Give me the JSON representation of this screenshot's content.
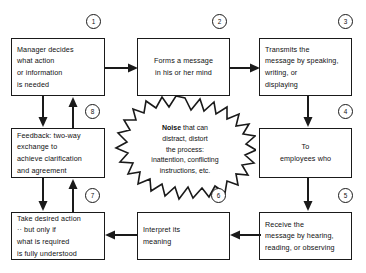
{
  "diagram": {
    "line_color": "#1a1a1a",
    "background": "#ffffff",
    "boxes": [
      {
        "id": "box1",
        "step": "1",
        "text": "Manager decides\nwhat action\nor information\nis needed",
        "align": "left"
      },
      {
        "id": "box2",
        "step": "2",
        "text": "Forms a message\nin his or her mind",
        "align": "center"
      },
      {
        "id": "box3",
        "step": "3",
        "text": "Transmits the\nmessage by speaking,\nwriting, or\ndisplaying",
        "align": "left"
      },
      {
        "id": "box4",
        "step": "4",
        "text": "To\nemployees who",
        "align": "center"
      },
      {
        "id": "box5",
        "step": "5",
        "text": "Receive the\nmessage by hearing,\nreading, or observing",
        "align": "left"
      },
      {
        "id": "box6",
        "step": "6",
        "text": "Interpret its\nmeaning",
        "align": "left"
      },
      {
        "id": "box7",
        "step": "7",
        "text": "Take desired action\n·· but only if\nwhat is required\nis fully understood",
        "align": "left"
      },
      {
        "id": "box8",
        "step": "8",
        "text": "Feedback: two-way\nexchange to\nachieve clarification\nand agreement",
        "align": "left"
      }
    ],
    "steps": [
      "1",
      "2",
      "3",
      "4",
      "5",
      "6",
      "7",
      "8"
    ],
    "noise": {
      "lead": "Noise",
      "rest": " that can\ndistract, distort\nthe process:\ninattention, conflicting\ninstructions, etc."
    }
  }
}
